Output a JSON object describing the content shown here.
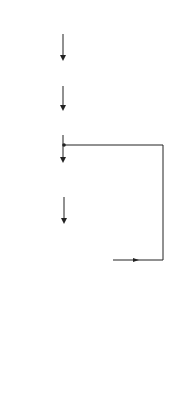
{
  "diagram": {
    "type": "flowchart",
    "nodes": {
      "start": {
        "shape": "terminal",
        "label": "START"
      },
      "read": {
        "shape": "io",
        "line1": "READ",
        "line2": "Y AND N"
      },
      "init": {
        "shape": "process",
        "line1": "ANS = Y",
        "line2": "M = 1"
      },
      "loop": {
        "shape": "process",
        "line1": "ANS = ANS * Y",
        "line2": "M = M + 1"
      },
      "decision": {
        "shape": "decision",
        "label": "M : N"
      },
      "print": {
        "shape": "io",
        "line1": "PRINT",
        "line2": "Y, N, ANS"
      },
      "stop": {
        "shape": "terminal",
        "label": "STOP"
      }
    },
    "edges": {
      "not_equal_label": "≠",
      "equal_label": "="
    },
    "colors": {
      "stroke": "#222222",
      "background": "#ffffff"
    }
  }
}
